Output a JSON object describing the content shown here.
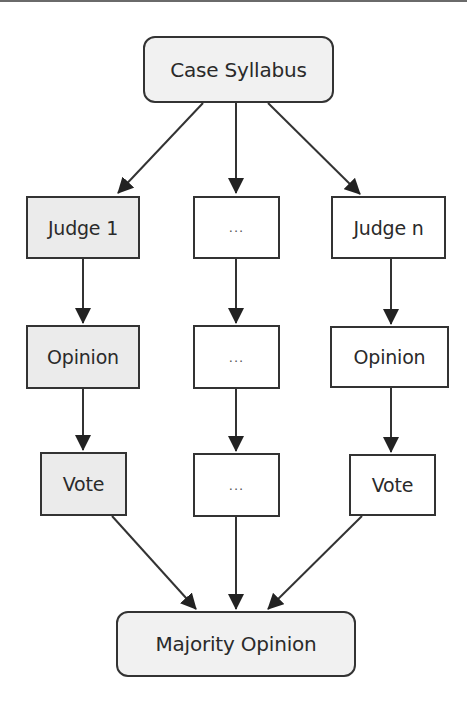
{
  "diagram": {
    "title_node": {
      "label": "Case Syllabus"
    },
    "output_node": {
      "label": "Majority Opinion"
    },
    "columns": [
      {
        "name": "judge-1",
        "shaded": true,
        "nodes": [
          {
            "label": "Judge 1"
          },
          {
            "label": "Opinion"
          },
          {
            "label": "Vote"
          }
        ]
      },
      {
        "name": "judge-middle",
        "shaded": false,
        "nodes": [
          {
            "label": "..."
          },
          {
            "label": "..."
          },
          {
            "label": "..."
          }
        ]
      },
      {
        "name": "judge-n",
        "shaded": false,
        "nodes": [
          {
            "label": "Judge n"
          },
          {
            "label": "Opinion"
          },
          {
            "label": "Vote"
          }
        ]
      }
    ],
    "edges": [
      [
        "Case Syllabus",
        "Judge 1"
      ],
      [
        "Case Syllabus",
        "..."
      ],
      [
        "Case Syllabus",
        "Judge n"
      ],
      [
        "Judge 1",
        "Opinion"
      ],
      [
        "Opinion",
        "Vote"
      ],
      [
        "...",
        "..."
      ],
      [
        "...",
        "..."
      ],
      [
        "Judge n",
        "Opinion"
      ],
      [
        "Opinion",
        "Vote"
      ],
      [
        "Vote",
        "Majority Opinion"
      ],
      [
        "...",
        "Majority Opinion"
      ],
      [
        "Vote",
        "Majority Opinion"
      ]
    ],
    "colors": {
      "stroke": "#333333",
      "shaded_fill": "#ebebeb",
      "rounded_fill": "#f1f1f1",
      "plain_fill": "#ffffff"
    }
  }
}
